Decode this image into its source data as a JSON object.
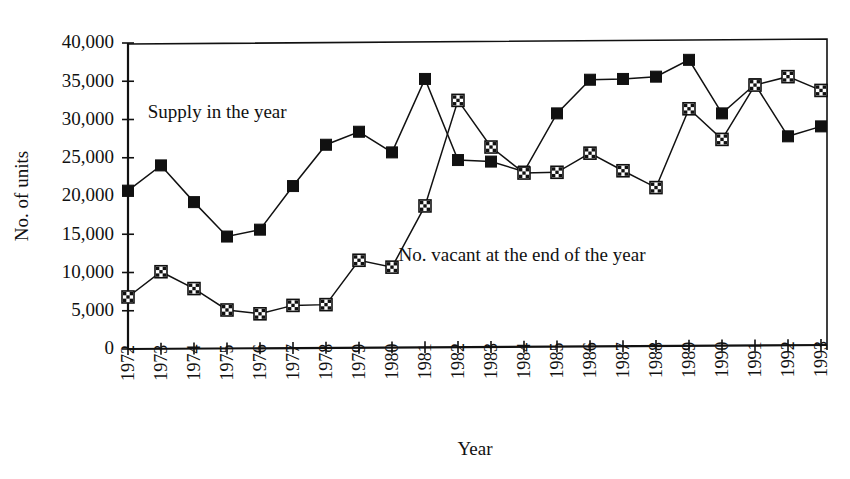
{
  "chart_data": {
    "type": "line",
    "title": "",
    "xlabel": "Year",
    "ylabel": "No. of units",
    "grid": false,
    "legend_position": "inline-annotation",
    "xlim": [
      1972,
      1993
    ],
    "ylim": [
      0,
      40000
    ],
    "ytick_labels": [
      "40,000",
      "35,000",
      "30,000",
      "25,000",
      "20,000",
      "15,000",
      "10,000",
      "5,000",
      "0"
    ],
    "ytick_values": [
      40000,
      35000,
      30000,
      25000,
      20000,
      15000,
      10000,
      5000,
      0
    ],
    "categories": [
      "1972",
      "1973",
      "1974",
      "1975",
      "1976",
      "1977",
      "1978",
      "1979",
      "1980",
      "1981",
      "1982",
      "1983",
      "1984",
      "1985",
      "1986",
      "1987",
      "1988",
      "1989",
      "1990",
      "1991",
      "1992",
      "1993"
    ],
    "x": [
      1972,
      1973,
      1974,
      1975,
      1976,
      1977,
      1978,
      1979,
      1980,
      1981,
      1982,
      1983,
      1984,
      1985,
      1986,
      1987,
      1988,
      1989,
      1990,
      1991,
      1992,
      1993
    ],
    "series": [
      {
        "name": "Supply in the year",
        "marker": "filled-square",
        "values": [
          20700,
          24000,
          19200,
          14700,
          15600,
          21300,
          26700,
          28400,
          25700,
          35300,
          24700,
          24500,
          23200,
          30800,
          35200,
          35300,
          35600,
          37800,
          30800,
          34600,
          27800,
          29100
        ]
      },
      {
        "name": "No. vacant at the end of the year",
        "marker": "hatched-square",
        "values": [
          6800,
          10100,
          7900,
          5100,
          4600,
          5700,
          5800,
          11600,
          10700,
          18700,
          32500,
          26400,
          23000,
          23100,
          25600,
          23300,
          21100,
          31400,
          27400,
          34500,
          35600,
          33800
        ]
      }
    ],
    "annotations": [
      {
        "text": "Supply in the year",
        "x": 1972.6,
        "y": 30200
      },
      {
        "text": "No. vacant at the end of the year",
        "x": 1980.2,
        "y": 11500
      }
    ]
  },
  "colors": {
    "ink": "#111111",
    "background": "#ffffff"
  }
}
